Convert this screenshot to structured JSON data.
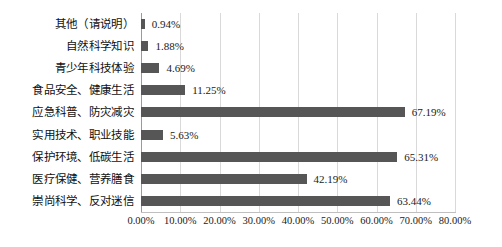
{
  "chart_data": {
    "type": "bar",
    "orientation": "horizontal",
    "title": "",
    "subtitle": "",
    "xlabel": "",
    "ylabel": "",
    "grid": true,
    "legend": false,
    "xlim": [
      0,
      80
    ],
    "xtick_step": 10,
    "xticks": [
      "0.00%",
      "10.00%",
      "20.00%",
      "30.00%",
      "40.00%",
      "50.00%",
      "60.00%",
      "70.00%",
      "80.00%"
    ],
    "bar_color": "#565656",
    "gridline_color": "#d9d9d9",
    "axis_color": "#bfbfbf",
    "categories": [
      "其他（请说明）",
      "自然科学知识",
      "青少年科技体验",
      "食品安全、健康生活",
      "应急科普、防灾减灾",
      "实用技术、职业技能",
      "保护环境、低碳生活",
      "医疗保健、营养膳食",
      "崇尚科学、反对迷信"
    ],
    "values": [
      0.94,
      1.88,
      4.69,
      11.25,
      67.19,
      5.63,
      65.31,
      42.19,
      63.44
    ],
    "labels": [
      "0.94%",
      "1.88%",
      "4.69%",
      "11.25%",
      "67.19%",
      "5.63%",
      "65.31%",
      "42.19%",
      "63.44%"
    ]
  }
}
